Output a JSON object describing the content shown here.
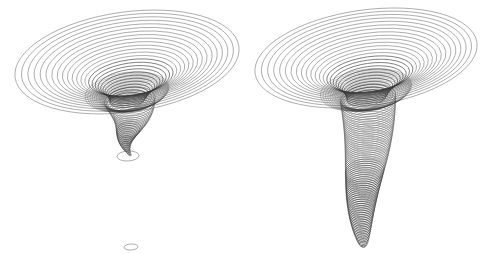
{
  "figure": {
    "title": "",
    "width": 489,
    "height": 254,
    "background_color": "#ffffff",
    "stroke_color": "#555555",
    "stroke_color_dense": "#333333"
  },
  "chart_data": {
    "type": "line",
    "title": "",
    "subtitle": "",
    "xlabel": "",
    "ylabel": "",
    "grid": false,
    "legend": null,
    "axis_visible": false,
    "tick_labels": [],
    "annotations": [],
    "panels": [
      {
        "name": "left-funnel",
        "label": "",
        "render_style": "ellipse-stack-wireframe",
        "tail_style": "sparse-broken",
        "center_x": 127,
        "rim_center_y": 62,
        "rim_rx": 113,
        "rim_ry": 50,
        "rim_tilt_deg": -8,
        "throat_y": 100,
        "throat_rx": 18,
        "tail_bottom_y": 247,
        "ring_count": 58,
        "rim_ring_count": 26,
        "outer_extent": {
          "left_x": 14,
          "right_x": 240,
          "top_y": 12,
          "bottom_y": 112
        },
        "isolated_rings": [
          {
            "cx": 128,
            "cy": 156,
            "rx": 11,
            "ry": 5
          },
          {
            "cx": 131,
            "cy": 247,
            "rx": 7,
            "ry": 3
          }
        ]
      },
      {
        "name": "right-funnel",
        "label": "",
        "render_style": "ellipse-stack-wireframe",
        "tail_style": "dense-continuous",
        "center_x": 366,
        "rim_center_y": 58,
        "rim_rx": 112,
        "rim_ry": 48,
        "rim_tilt_deg": -8,
        "throat_y": 98,
        "throat_rx": 20,
        "tail_bottom_y": 246,
        "ring_count": 96,
        "rim_ring_count": 26,
        "outer_extent": {
          "left_x": 255,
          "right_x": 479,
          "top_y": 8,
          "bottom_y": 108
        },
        "isolated_rings": []
      }
    ]
  }
}
